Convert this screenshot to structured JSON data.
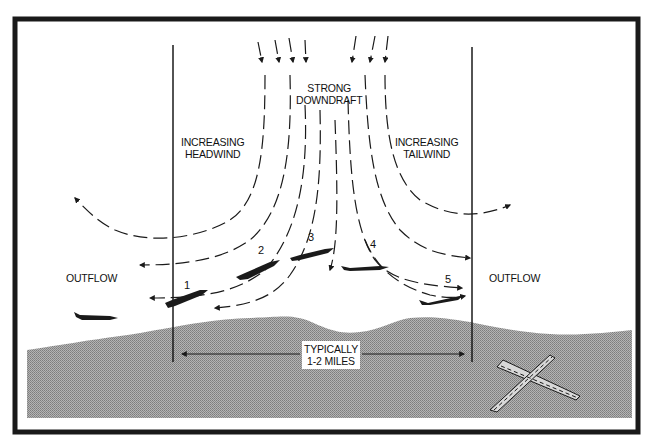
{
  "diagram": {
    "colors": {
      "frame": "#1a1a1a",
      "ground": "#9e9e9e",
      "ink": "#1a1a1a",
      "background": "#ffffff"
    },
    "labels": {
      "downdraft_line1": "STRONG",
      "downdraft_line2": "DOWNDRAFT",
      "headwind_line1": "INCREASING",
      "headwind_line2": "HEADWIND",
      "tailwind_line1": "INCREASING",
      "tailwind_line2": "TAILWIND",
      "outflow_left": "OUTFLOW",
      "outflow_right": "OUTFLOW",
      "distance_line1": "TYPICALLY",
      "distance_line2": "1-2 MILES"
    },
    "aircraft_positions": [
      {
        "label": "1"
      },
      {
        "label": "2"
      },
      {
        "label": "3"
      },
      {
        "label": "4"
      },
      {
        "label": "5"
      }
    ],
    "icons": {
      "aircraft": "aircraft-silhouette-icon",
      "runway": "crossed-runway-icon",
      "wind_arrow": "wind-arrow-icon"
    }
  }
}
